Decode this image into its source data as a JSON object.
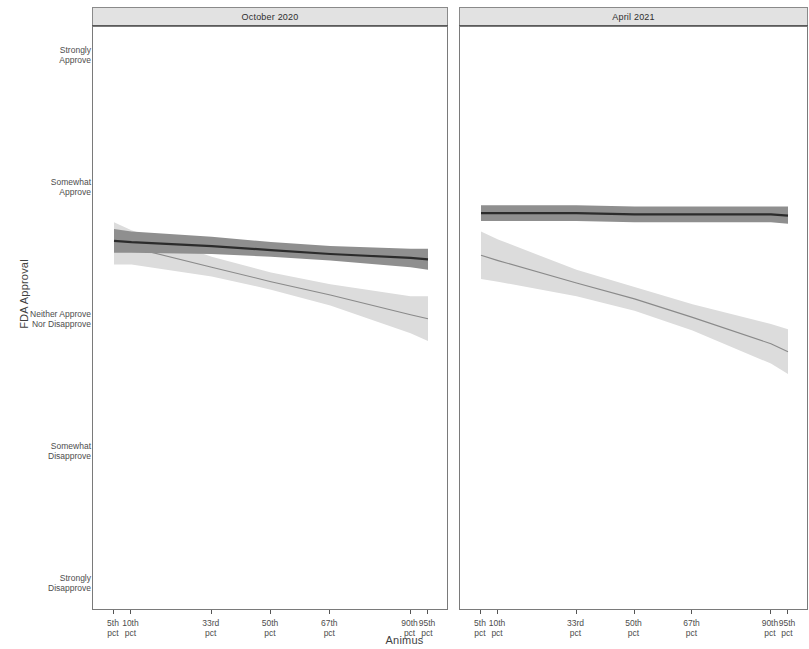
{
  "figure": {
    "width": 809,
    "height": 649,
    "background": "#ffffff"
  },
  "axes": {
    "y_title": "FDA Approval",
    "x_title": "Animus"
  },
  "chart_data": {
    "type": "line",
    "title": "",
    "subtitle": "",
    "xlabel": "Animus",
    "ylabel": "FDA Approval",
    "grid": false,
    "legend": "none",
    "facet_layout": "1 row x 2 columns, shared y axis",
    "x": [
      5,
      10,
      33,
      50,
      67,
      90,
      95
    ],
    "x_tick_labels": [
      "5th\npct",
      "10th\npct",
      "33rd\npct",
      "50th\npct",
      "67th\npct",
      "90th\npct",
      "95th\npct"
    ],
    "y_tick_labels": [
      "Strongly\nApprove",
      "Somewhat\nApprove",
      "Neither Approve\nNor Disapprove",
      "Somewhat\nDisapprove",
      "Strongly\nDisapprove"
    ],
    "y_tick_values": [
      5,
      4,
      3,
      2,
      1
    ],
    "ylim": [
      1,
      5
    ],
    "band_type": "95% confidence interval",
    "panels": [
      {
        "label": "October 2020",
        "series": [
          {
            "name": "dark-series",
            "color": "#2b2b2b",
            "band_color": "#8f8f8f",
            "values": [
              3.6,
              3.59,
              3.56,
              3.53,
              3.5,
              3.47,
              3.46
            ],
            "band_low": [
              3.51,
              3.51,
              3.5,
              3.48,
              3.45,
              3.4,
              3.38
            ],
            "band_high": [
              3.69,
              3.67,
              3.63,
              3.59,
              3.56,
              3.54,
              3.54
            ]
          },
          {
            "name": "light-series",
            "color": "#8a8a8a",
            "band_color": "#dcdcdc",
            "values": [
              3.58,
              3.55,
              3.4,
              3.29,
              3.19,
              3.04,
              3.01
            ],
            "band_low": [
              3.42,
              3.42,
              3.33,
              3.23,
              3.11,
              2.9,
              2.84
            ],
            "band_high": [
              3.74,
              3.68,
              3.48,
              3.36,
              3.27,
              3.18,
              3.18
            ]
          }
        ]
      },
      {
        "label": "April 2021",
        "series": [
          {
            "name": "dark-series",
            "color": "#2b2b2b",
            "band_color": "#8f8f8f",
            "values": [
              3.81,
              3.81,
              3.81,
              3.8,
              3.8,
              3.8,
              3.79
            ],
            "band_low": [
              3.75,
              3.75,
              3.75,
              3.74,
              3.74,
              3.74,
              3.73
            ],
            "band_high": [
              3.87,
              3.87,
              3.87,
              3.86,
              3.86,
              3.86,
              3.86
            ]
          },
          {
            "name": "light-series",
            "color": "#8a8a8a",
            "band_color": "#dcdcdc",
            "values": [
              3.49,
              3.45,
              3.28,
              3.16,
              3.02,
              2.82,
              2.76
            ],
            "band_low": [
              3.31,
              3.29,
              3.18,
              3.07,
              2.92,
              2.67,
              2.59
            ],
            "band_high": [
              3.67,
              3.61,
              3.38,
              3.25,
              3.12,
              2.97,
              2.93
            ]
          }
        ]
      }
    ]
  },
  "panel_layout": {
    "left": {
      "x": 92,
      "width": 356
    },
    "right": {
      "x": 459,
      "width": 349
    }
  }
}
